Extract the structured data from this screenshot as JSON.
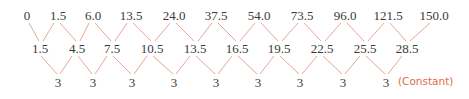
{
  "diagram": {
    "line_color": "#e8a693",
    "text_color": "#3a3a3a",
    "note_color": "#e26b4a",
    "rows": {
      "values": {
        "y": 15,
        "items": [
          {
            "label": "0",
            "x": 27
          },
          {
            "label": "1.5",
            "x": 58
          },
          {
            "label": "6.0",
            "x": 93
          },
          {
            "label": "13.5",
            "x": 131
          },
          {
            "label": "24.0",
            "x": 174
          },
          {
            "label": "37.5",
            "x": 216
          },
          {
            "label": "54.0",
            "x": 259
          },
          {
            "label": "73.5",
            "x": 302
          },
          {
            "label": "96.0",
            "x": 345
          },
          {
            "label": "121.5",
            "x": 388
          },
          {
            "label": "150.0",
            "x": 434
          }
        ]
      },
      "first_differences": {
        "y": 48,
        "items": [
          {
            "label": "1.5",
            "x": 40
          },
          {
            "label": "4.5",
            "x": 77
          },
          {
            "label": "7.5",
            "x": 112
          },
          {
            "label": "10.5",
            "x": 152
          },
          {
            "label": "13.5",
            "x": 195
          },
          {
            "label": "16.5",
            "x": 237
          },
          {
            "label": "19.5",
            "x": 279
          },
          {
            "label": "22.5",
            "x": 322
          },
          {
            "label": "25.5",
            "x": 365
          },
          {
            "label": "28.5",
            "x": 407
          }
        ]
      },
      "second_differences": {
        "y": 82,
        "items": [
          {
            "label": "3",
            "x": 58
          },
          {
            "label": "3",
            "x": 93
          },
          {
            "label": "3",
            "x": 132
          },
          {
            "label": "3",
            "x": 174
          },
          {
            "label": "3",
            "x": 216
          },
          {
            "label": "3",
            "x": 258
          },
          {
            "label": "3",
            "x": 300
          },
          {
            "label": "3",
            "x": 343
          },
          {
            "label": "3",
            "x": 386
          }
        ],
        "note": {
          "label": "(Constant)",
          "x": 398
        }
      }
    }
  }
}
